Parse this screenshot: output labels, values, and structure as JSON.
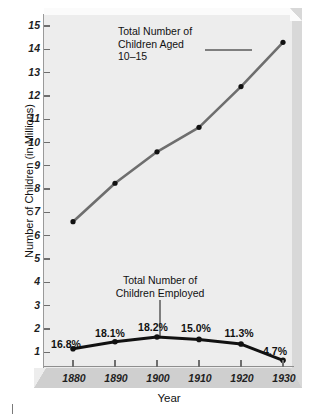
{
  "chart_data": {
    "type": "line",
    "title": "",
    "xlabel": "Year",
    "ylabel": "Number of Children (in Millions)",
    "x": [
      1880,
      1890,
      1900,
      1910,
      1920,
      1930
    ],
    "xtick_labels": [
      "1880",
      "1890",
      "1900",
      "1910",
      "1920",
      "1930"
    ],
    "ytick_labels": [
      "1",
      "2",
      "3",
      "4",
      "5",
      "6",
      "7",
      "8",
      "9",
      "10",
      "11",
      "12",
      "13",
      "14",
      "15"
    ],
    "ylim": [
      0,
      15.6
    ],
    "grid": false,
    "legend_position": "inline-annotations",
    "series": [
      {
        "name": "Total Number of Children Aged 10–15",
        "color": "#6e6e6e",
        "marker_color": "#111111",
        "values": [
          6.6,
          8.25,
          9.6,
          10.65,
          12.4,
          14.3
        ]
      },
      {
        "name": "Total Number of Children Employed",
        "color": "#111111",
        "marker_color": "#111111",
        "values": [
          1.15,
          1.45,
          1.65,
          1.55,
          1.35,
          0.65
        ],
        "point_labels": [
          "16.8%",
          "18.1%",
          "18.2%",
          "15.0%",
          "11.3%",
          "4.7%"
        ]
      }
    ],
    "annotations": [
      {
        "id": "aged-label",
        "lines": [
          "Total Number of",
          "Children Aged",
          "10–15"
        ],
        "leader": "horizontal"
      },
      {
        "id": "employed-label",
        "lines": [
          "Total Number of",
          "Children Employed"
        ],
        "leader": "vertical"
      }
    ]
  },
  "axes": {
    "y_title": "Number of Children (in Millions)",
    "x_title": "Year",
    "y_labels": [
      "15",
      "14",
      "13",
      "12",
      "11",
      "10",
      "9",
      "8",
      "7",
      "6",
      "5",
      "4",
      "3",
      "2",
      "1"
    ],
    "x_labels": [
      "1880",
      "1890",
      "1900",
      "1910",
      "1920",
      "1930"
    ]
  },
  "annotations": {
    "aged": {
      "line1": "Total Number of",
      "line2": "Children Aged",
      "line3": "10–15"
    },
    "employed": {
      "line1": "Total Number of",
      "line2": "Children Employed"
    }
  },
  "percent_labels": {
    "p1880": "16.8%",
    "p1890": "18.1%",
    "p1900": "18.2%",
    "p1910": "15.0%",
    "p1920": "11.3%",
    "p1930": "4.7%"
  },
  "colors": {
    "plot_background": "#ededed",
    "bevel_right": "#d8d8d8",
    "x_band": "#cfcfcf",
    "series_gray": "#6e6e6e",
    "series_black": "#111111",
    "axis": "#8e8e8e"
  }
}
